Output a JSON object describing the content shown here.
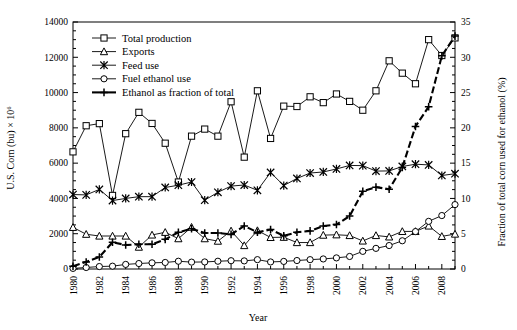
{
  "chart_data": {
    "type": "line",
    "title": "",
    "xlabel": "Year",
    "ylabel": "U.S. Corn (bu) × 10⁶",
    "y2label": "Fraction of total corn used for ethanol (%)",
    "xlim": [
      1980,
      2009
    ],
    "ylim": [
      0,
      14000
    ],
    "y2lim": [
      0,
      35
    ],
    "yticks": [
      0,
      2000,
      4000,
      6000,
      8000,
      10000,
      12000,
      14000
    ],
    "y2ticks": [
      0,
      5,
      10,
      15,
      20,
      25,
      30,
      35
    ],
    "xticks": [
      1980,
      1982,
      1984,
      1986,
      1988,
      1990,
      1992,
      1994,
      1996,
      1998,
      2000,
      2002,
      2004,
      2006,
      2008
    ],
    "xtick_labels": [
      "1980",
      "1982",
      "1984",
      "1986",
      "1988",
      "1990",
      "1992",
      "1994",
      "1996",
      "1998",
      "2000",
      "2002",
      "2004",
      "2006",
      "2008"
    ],
    "xtick_rotation": 90,
    "grid": false,
    "legend_position": "top-left",
    "x": [
      1980,
      1981,
      1982,
      1983,
      1984,
      1985,
      1986,
      1987,
      1988,
      1989,
      1990,
      1991,
      1992,
      1993,
      1994,
      1995,
      1996,
      1997,
      1998,
      1999,
      2000,
      2001,
      2002,
      2003,
      2004,
      2005,
      2006,
      2007,
      2008,
      2009
    ],
    "series": [
      {
        "name": "Total production",
        "marker": "square",
        "axis": "left",
        "linestyle": "solid",
        "values": [
          6640,
          8120,
          8240,
          4170,
          7670,
          8880,
          8250,
          7130,
          4930,
          7530,
          7930,
          7530,
          9480,
          6340,
          10100,
          7400,
          9230,
          9210,
          9760,
          9430,
          9920,
          9500,
          9000,
          10100,
          11800,
          11100,
          10500,
          13000,
          12100,
          13100
        ]
      },
      {
        "name": "Exports",
        "marker": "triangle",
        "axis": "left",
        "linestyle": "solid",
        "values": [
          2360,
          1970,
          1870,
          1870,
          1870,
          1240,
          1930,
          2080,
          1720,
          2370,
          1720,
          1580,
          2160,
          1330,
          2180,
          1790,
          1800,
          1500,
          1500,
          1920,
          1940,
          1900,
          1590,
          1900,
          1820,
          2130,
          2130,
          2440,
          1850,
          1980
        ]
      },
      {
        "name": "Feed use",
        "marker": "star",
        "axis": "left",
        "linestyle": "solid",
        "values": [
          4220,
          4200,
          4510,
          3880,
          4000,
          4100,
          4100,
          4620,
          4750,
          4930,
          3900,
          4350,
          4700,
          4760,
          4460,
          5470,
          4730,
          5130,
          5440,
          5500,
          5670,
          5870,
          5860,
          5550,
          5560,
          5810,
          5940,
          5900,
          5300,
          5400
        ]
      },
      {
        "name": "Fuel ethanol use",
        "marker": "circle",
        "axis": "left",
        "linestyle": "solid",
        "values": [
          35,
          85,
          140,
          160,
          260,
          310,
          350,
          370,
          440,
          390,
          400,
          440,
          470,
          460,
          530,
          400,
          430,
          480,
          530,
          570,
          630,
          710,
          1000,
          1170,
          1330,
          1600,
          2120,
          2700,
          3030,
          3650
        ]
      },
      {
        "name": "Ethanol as fraction of total",
        "marker": "plus",
        "axis": "right",
        "linestyle": "dashed-thick",
        "values": [
          0.4,
          1.0,
          1.7,
          3.8,
          3.4,
          3.5,
          3.5,
          4.2,
          5.2,
          5.7,
          5.1,
          5.1,
          4.9,
          6.1,
          5.2,
          5.6,
          4.7,
          5.2,
          5.4,
          6.1,
          6.3,
          7.5,
          11.0,
          11.6,
          11.3,
          14.4,
          20.2,
          23.0,
          30.2,
          33.0
        ]
      }
    ]
  },
  "legend": {
    "items": [
      {
        "label": "Total production"
      },
      {
        "label": "Exports"
      },
      {
        "label": "Feed use"
      },
      {
        "label": "Fuel ethanol use"
      },
      {
        "label": "Ethanol as fraction of total"
      }
    ]
  }
}
